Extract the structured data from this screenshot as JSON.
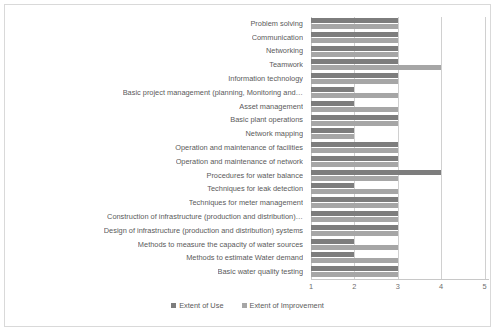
{
  "chart_data": {
    "type": "bar",
    "orientation": "horizontal",
    "title": "",
    "xlabel": "",
    "ylabel": "",
    "xlim": [
      1,
      5
    ],
    "xticks": [
      "1",
      "2",
      "3",
      "4",
      "5"
    ],
    "grid": true,
    "legend_position": "bottom",
    "categories": [
      "Problem solving",
      "Communication",
      "Networking",
      "Teamwork",
      "Information technology",
      "Basic project management (planning, Monitoring and…",
      "Asset management",
      "Basic plant operations",
      "Network mapping",
      "Operation and maintenance of facilities",
      "Operation and maintenance of network",
      "Procedures for water balance",
      "Techniques  for leak detection",
      "Techniques for meter management",
      "Construction of infrastructure (production and distribution)…",
      "Design of infrastructure (production and distribution) systems",
      "Methods to measure the capacity of water sources",
      "Methods to estimate Water demand",
      "Basic water quality testing"
    ],
    "series": [
      {
        "name": "Extent of Use",
        "color": "#7d7d7d",
        "values": [
          3,
          3,
          3,
          3,
          3,
          2,
          2,
          3,
          2,
          3,
          3,
          4,
          2,
          3,
          3,
          3,
          2,
          2,
          3
        ]
      },
      {
        "name": "Extent of Improvement",
        "color": "#a6a6a6",
        "values": [
          3,
          3,
          3,
          4,
          3,
          3,
          3,
          3,
          2,
          3,
          3,
          3,
          3,
          3,
          3,
          3,
          3,
          3,
          3
        ]
      }
    ]
  },
  "legend": {
    "items": [
      {
        "label": "Extent of Use"
      },
      {
        "label": "Extent of Improvement"
      }
    ]
  }
}
